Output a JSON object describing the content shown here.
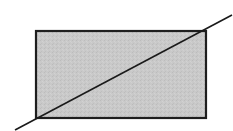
{
  "diagram": {
    "rectangle": {
      "x": 36,
      "y": 31,
      "width": 170,
      "height": 87,
      "fill": "#c8c8c8",
      "stroke": "#1e1e1e",
      "stroke_width": 2.2
    },
    "line": {
      "x1": 15,
      "y1": 130,
      "x2": 232,
      "y2": 15,
      "stroke": "#1a1a1a",
      "stroke_width": 1.6
    },
    "background": "#ffffff"
  }
}
